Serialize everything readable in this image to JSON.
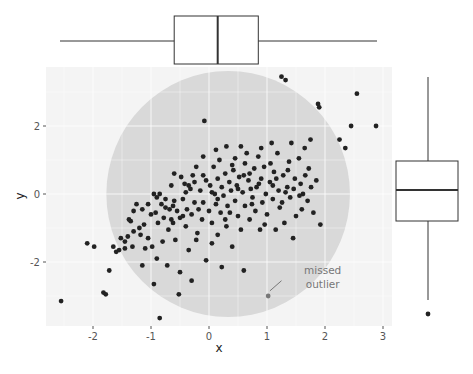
{
  "chart_data": {
    "type": "scatter",
    "title": "",
    "xlabel": "x",
    "ylabel": "y",
    "xlim": [
      -2.65,
      3.15
    ],
    "ylim": [
      -3.9,
      3.8
    ],
    "x_ticks": [
      -2,
      -1,
      0,
      1,
      2,
      3
    ],
    "y_ticks": [
      -2,
      0,
      2
    ],
    "x_tick_labels": [
      "-2",
      "-1",
      "0",
      "1",
      "2",
      "3"
    ],
    "y_tick_labels": [
      "-2",
      "0",
      "2"
    ],
    "grid": true,
    "panel_background": "#f4f4f4",
    "grid_color": "#ffffff",
    "point_color": "#222222",
    "highlight": {
      "shape": "circle",
      "center": [
        0.33,
        0.0
      ],
      "radius_x": 2.1,
      "radius_y": 3.62,
      "color": "#d9d9d9"
    },
    "annotation": {
      "lines": [
        "missed",
        "outlier"
      ],
      "text_x": 1.65,
      "text_y": -2.25,
      "arrow_from": [
        1.25,
        -2.55
      ],
      "arrow_to": [
        1.05,
        -2.85
      ],
      "point": [
        1.02,
        -3.0
      ],
      "color": "#777777"
    },
    "points": [
      [
        -2.55,
        -3.15
      ],
      [
        -2.1,
        -1.45
      ],
      [
        -1.98,
        -1.55
      ],
      [
        -1.82,
        -2.9
      ],
      [
        -1.78,
        -2.95
      ],
      [
        -1.72,
        -2.25
      ],
      [
        -1.65,
        -1.55
      ],
      [
        -1.6,
        -1.7
      ],
      [
        -1.55,
        -1.65
      ],
      [
        -1.52,
        -1.3
      ],
      [
        -1.45,
        -1.6
      ],
      [
        -1.4,
        -1.25
      ],
      [
        -1.38,
        -0.75
      ],
      [
        -1.35,
        -0.8
      ],
      [
        -1.32,
        -1.55
      ],
      [
        -1.3,
        -1.1
      ],
      [
        -1.25,
        -0.3
      ],
      [
        -1.2,
        -1.0
      ],
      [
        -1.18,
        -1.2
      ],
      [
        -1.15,
        -2.1
      ],
      [
        -1.12,
        -0.9
      ],
      [
        -1.1,
        -1.6
      ],
      [
        -1.05,
        -1.3
      ],
      [
        -1.05,
        -0.3
      ],
      [
        -1.0,
        -0.6
      ],
      [
        -0.98,
        -1.55
      ],
      [
        -0.95,
        -2.65
      ],
      [
        -0.92,
        -0.55
      ],
      [
        -0.9,
        -0.1
      ],
      [
        -0.9,
        -1.9
      ],
      [
        -0.88,
        -0.85
      ],
      [
        -0.85,
        0.0
      ],
      [
        -0.85,
        -3.65
      ],
      [
        -0.82,
        -0.3
      ],
      [
        -0.8,
        -1.4
      ],
      [
        -0.78,
        -0.7
      ],
      [
        -0.75,
        -0.4
      ],
      [
        -0.72,
        -2.1
      ],
      [
        -0.7,
        -1.05
      ],
      [
        -0.68,
        -0.45
      ],
      [
        -0.65,
        0.25
      ],
      [
        -0.65,
        -0.75
      ],
      [
        -0.62,
        -0.35
      ],
      [
        -0.6,
        0.6
      ],
      [
        -0.58,
        -1.35
      ],
      [
        -0.55,
        -0.5
      ],
      [
        -0.52,
        -2.95
      ],
      [
        -0.5,
        -0.7
      ],
      [
        -0.5,
        -2.3
      ],
      [
        -0.48,
        0.5
      ],
      [
        -0.45,
        -0.15
      ],
      [
        -0.42,
        0.3
      ],
      [
        -0.4,
        -0.95
      ],
      [
        -0.38,
        -0.45
      ],
      [
        -0.35,
        -1.65
      ],
      [
        -0.32,
        0.15
      ],
      [
        -0.3,
        -0.6
      ],
      [
        -0.3,
        -2.55
      ],
      [
        -0.28,
        0.55
      ],
      [
        -0.25,
        -0.25
      ],
      [
        -0.22,
        0.8
      ],
      [
        -0.2,
        -1.15
      ],
      [
        -0.18,
        -0.45
      ],
      [
        -0.15,
        0.1
      ],
      [
        -0.12,
        -0.75
      ],
      [
        -0.1,
        1.1
      ],
      [
        -0.1,
        -0.25
      ],
      [
        -0.08,
        2.15
      ],
      [
        -0.05,
        -1.95
      ],
      [
        -0.05,
        0.4
      ],
      [
        0.0,
        -0.5
      ],
      [
        0.02,
        0.25
      ],
      [
        0.05,
        -0.85
      ],
      [
        0.05,
        -1.45
      ],
      [
        0.08,
        0.8
      ],
      [
        0.1,
        0.0
      ],
      [
        0.12,
        -0.3
      ],
      [
        0.15,
        -1.2
      ],
      [
        0.15,
        0.45
      ],
      [
        0.18,
        1.0
      ],
      [
        0.2,
        -0.55
      ],
      [
        0.22,
        0.2
      ],
      [
        0.22,
        -2.15
      ],
      [
        0.25,
        -0.05
      ],
      [
        0.28,
        0.6
      ],
      [
        0.3,
        -0.95
      ],
      [
        0.3,
        1.4
      ],
      [
        0.32,
        -0.35
      ],
      [
        0.35,
        0.35
      ],
      [
        0.38,
        0.1
      ],
      [
        0.4,
        -1.55
      ],
      [
        0.42,
        0.7
      ],
      [
        0.45,
        -0.2
      ],
      [
        0.45,
        1.05
      ],
      [
        0.48,
        0.25
      ],
      [
        0.5,
        -0.65
      ],
      [
        0.52,
        0.5
      ],
      [
        0.55,
        -1.05
      ],
      [
        0.58,
        0.05
      ],
      [
        0.6,
        0.55
      ],
      [
        0.6,
        -2.25
      ],
      [
        0.62,
        -0.35
      ],
      [
        0.65,
        1.2
      ],
      [
        0.68,
        0.4
      ],
      [
        0.7,
        -0.75
      ],
      [
        0.72,
        0.15
      ],
      [
        0.75,
        -0.1
      ],
      [
        0.78,
        0.75
      ],
      [
        0.8,
        -0.5
      ],
      [
        0.82,
        0.2
      ],
      [
        0.85,
        1.1
      ],
      [
        0.88,
        -1.05
      ],
      [
        0.9,
        0.45
      ],
      [
        0.92,
        -0.25
      ],
      [
        0.95,
        0.8
      ],
      [
        0.98,
        0.0
      ],
      [
        1.0,
        -0.6
      ],
      [
        1.02,
        -3.0
      ],
      [
        1.05,
        0.35
      ],
      [
        1.08,
        1.5
      ],
      [
        1.1,
        -0.15
      ],
      [
        1.12,
        0.65
      ],
      [
        1.15,
        -1.05
      ],
      [
        1.18,
        1.2
      ],
      [
        1.2,
        0.1
      ],
      [
        1.22,
        -0.4
      ],
      [
        1.25,
        3.45
      ],
      [
        1.28,
        0.55
      ],
      [
        1.3,
        -0.85
      ],
      [
        1.32,
        3.35
      ],
      [
        1.35,
        0.2
      ],
      [
        1.38,
        0.95
      ],
      [
        1.4,
        -0.1
      ],
      [
        1.42,
        1.5
      ],
      [
        1.45,
        -1.3
      ],
      [
        1.48,
        0.45
      ],
      [
        1.5,
        -0.65
      ],
      [
        1.55,
        1.05
      ],
      [
        1.58,
        0.3
      ],
      [
        1.6,
        -0.45
      ],
      [
        1.62,
        0.0
      ],
      [
        1.65,
        1.35
      ],
      [
        1.7,
        -0.2
      ],
      [
        1.72,
        0.75
      ],
      [
        1.75,
        1.6
      ],
      [
        1.8,
        -0.55
      ],
      [
        1.85,
        0.4
      ],
      [
        1.88,
        2.65
      ],
      [
        1.9,
        2.55
      ],
      [
        1.92,
        -0.9
      ],
      [
        -1.45,
        -1.4
      ],
      [
        -1.3,
        -0.5
      ],
      [
        -1.15,
        -0.45
      ],
      [
        -0.95,
        0.0
      ],
      [
        -0.75,
        -0.15
      ],
      [
        -0.62,
        -0.85
      ],
      [
        -0.45,
        -0.65
      ],
      [
        -0.35,
        0.25
      ],
      [
        -0.22,
        -1.35
      ],
      [
        -0.1,
        0.55
      ],
      [
        0.05,
        0.05
      ],
      [
        0.12,
        1.3
      ],
      [
        0.28,
        -0.75
      ],
      [
        0.36,
        -0.55
      ],
      [
        0.5,
        0.15
      ],
      [
        0.62,
        0.9
      ],
      [
        0.74,
        -0.3
      ],
      [
        0.86,
        0.3
      ],
      [
        0.96,
        -0.9
      ],
      [
        1.06,
        0.9
      ],
      [
        1.16,
        0.45
      ],
      [
        1.26,
        -0.25
      ],
      [
        1.36,
        0.7
      ],
      [
        1.46,
        0.15
      ],
      [
        1.56,
        -0.05
      ],
      [
        1.66,
        0.55
      ],
      [
        1.76,
        0.2
      ],
      [
        2.25,
        1.6
      ],
      [
        2.35,
        1.35
      ],
      [
        2.45,
        2.0
      ],
      [
        2.55,
        2.95
      ],
      [
        2.88,
        2.0
      ],
      [
        -0.6,
        -0.2
      ],
      [
        -0.4,
        0.05
      ],
      [
        -0.25,
        0.35
      ],
      [
        0.15,
        -0.15
      ],
      [
        0.4,
        0.85
      ],
      [
        0.55,
        1.4
      ],
      [
        0.7,
        0.6
      ],
      [
        0.9,
        1.35
      ],
      [
        1.1,
        0.25
      ],
      [
        1.32,
        0.05
      ]
    ],
    "top_boxplot": {
      "variable": "x",
      "whisker_low": -2.55,
      "q1": -0.6,
      "median": 0.15,
      "q3": 0.85,
      "whisker_high": 2.88,
      "outliers": []
    },
    "right_boxplot": {
      "variable": "y",
      "whisker_high": 3.45,
      "q1": -0.8,
      "median": 0.1,
      "q3": 0.95,
      "whisker_low": -3.15,
      "outliers": [
        -3.6
      ]
    }
  }
}
